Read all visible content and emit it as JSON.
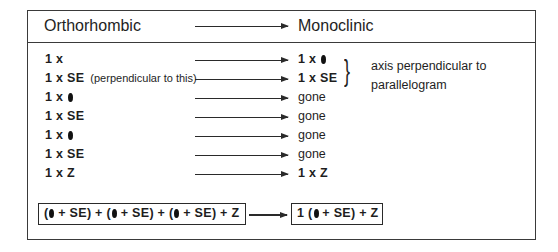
{
  "header": {
    "left": "Orthorhombic",
    "right": "Monoclinic"
  },
  "rows": [
    {
      "left": "1 x",
      "left_symbol": "",
      "note": "",
      "right": "1 x",
      "right_symbol": "dot",
      "right_style": "bold"
    },
    {
      "left": "1 x SE",
      "left_symbol": "",
      "note": "(perpendicular to this)",
      "right": "1 x SE",
      "right_symbol": "",
      "right_style": "bold"
    },
    {
      "left": "1 x",
      "left_symbol": "dot",
      "note": "",
      "right": "gone",
      "right_symbol": "",
      "right_style": "plain"
    },
    {
      "left": "1 x SE",
      "left_symbol": "",
      "note": "",
      "right": "gone",
      "right_symbol": "",
      "right_style": "plain"
    },
    {
      "left": "1 x",
      "left_symbol": "dot",
      "note": "",
      "right": "gone",
      "right_symbol": "",
      "right_style": "plain"
    },
    {
      "left": "1 x SE",
      "left_symbol": "",
      "note": "",
      "right": "gone",
      "right_symbol": "",
      "right_style": "plain"
    },
    {
      "left": "1 x Z",
      "left_symbol": "",
      "note": "",
      "right": "1 x Z",
      "right_symbol": "",
      "right_style": "bold"
    }
  ],
  "annotation": {
    "line1": "axis perpendicular to",
    "line2": "parallelogram"
  },
  "formula": {
    "left_parts": [
      "(",
      " + SE) + (",
      " + SE) + (",
      " + SE) + Z"
    ],
    "right_parts": [
      "1 (",
      " + SE) + Z"
    ]
  },
  "symbols": {
    "dot": "filled-ellipse"
  },
  "colors": {
    "line": "#2a2a2a",
    "text": "#1e1e1e",
    "background": "#ffffff"
  }
}
